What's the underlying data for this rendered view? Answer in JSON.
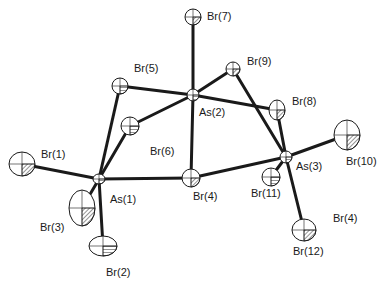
{
  "diagram": {
    "type": "ORTEP molecular structure",
    "colors": {
      "bond": "#1a1a1a",
      "atom_fill": "#ffffff",
      "hatch": "#2a2a2a",
      "text": "#1a1a1a"
    },
    "atoms": [
      {
        "id": "Br7",
        "label": "Br(7)",
        "x": 193,
        "y": 17,
        "rx": 8,
        "ry": 8,
        "lx": 207,
        "ly": 11
      },
      {
        "id": "Br5",
        "label": "Br(5)",
        "x": 120,
        "y": 86,
        "rx": 8,
        "ry": 8,
        "lx": 134,
        "ly": 63
      },
      {
        "id": "Br9",
        "label": "Br(9)",
        "x": 233,
        "y": 69,
        "rx": 7,
        "ry": 7,
        "lx": 247,
        "ly": 56
      },
      {
        "id": "As2",
        "label": "As(2)",
        "x": 193,
        "y": 95,
        "rx": 6,
        "ry": 6,
        "lx": 199,
        "ly": 107
      },
      {
        "id": "Br8",
        "label": "Br(8)",
        "x": 277,
        "y": 110,
        "rx": 8,
        "ry": 10,
        "lx": 292,
        "ly": 96
      },
      {
        "id": "Br6",
        "label": "Br(6)",
        "x": 130,
        "y": 126,
        "rx": 9,
        "ry": 9,
        "lx": 150,
        "ly": 146
      },
      {
        "id": "Br1",
        "label": "Br(1)",
        "x": 22,
        "y": 164,
        "rx": 13,
        "ry": 12,
        "lx": 41,
        "ly": 149
      },
      {
        "id": "As1",
        "label": "As(1)",
        "x": 99,
        "y": 179,
        "rx": 6,
        "ry": 5,
        "lx": 110,
        "ly": 194
      },
      {
        "id": "Br10",
        "label": "Br(10)",
        "x": 347,
        "y": 135,
        "rx": 13,
        "ry": 15,
        "lx": 346,
        "ly": 156
      },
      {
        "id": "As3",
        "label": "As(3)",
        "x": 286,
        "y": 157,
        "rx": 6,
        "ry": 6,
        "lx": 296,
        "ly": 161
      },
      {
        "id": "Br4",
        "label": "Br(4)",
        "x": 191,
        "y": 178,
        "rx": 9,
        "ry": 9,
        "lx": 193,
        "ly": 191
      },
      {
        "id": "Br11",
        "label": "Br(11)",
        "x": 271,
        "y": 177,
        "rx": 9,
        "ry": 9,
        "lx": 251,
        "ly": 188
      },
      {
        "id": "Br3",
        "label": "Br(3)",
        "x": 82,
        "y": 208,
        "rx": 13,
        "ry": 18,
        "lx": 40,
        "ly": 222
      },
      {
        "id": "Br2",
        "label": "Br(2)",
        "x": 103,
        "y": 246,
        "rx": 14,
        "ry": 10,
        "lx": 106,
        "ly": 267
      },
      {
        "id": "Br12",
        "label": "Br(12)",
        "x": 304,
        "y": 230,
        "rx": 12,
        "ry": 11,
        "lx": 293,
        "ly": 246
      },
      {
        "id": "Br4b",
        "label": "Br(4)",
        "x": null,
        "y": null,
        "rx": 0,
        "ry": 0,
        "lx": 333,
        "ly": 213
      }
    ],
    "bonds": [
      [
        "As2",
        "Br7"
      ],
      [
        "As2",
        "Br5"
      ],
      [
        "As2",
        "Br9"
      ],
      [
        "As2",
        "Br8"
      ],
      [
        "As2",
        "Br6"
      ],
      [
        "As2",
        "Br4"
      ],
      [
        "As1",
        "Br5"
      ],
      [
        "As1",
        "Br6"
      ],
      [
        "As1",
        "Br4"
      ],
      [
        "As1",
        "Br1"
      ],
      [
        "As1",
        "Br3"
      ],
      [
        "As1",
        "Br2"
      ],
      [
        "As3",
        "Br4"
      ],
      [
        "As3",
        "Br8"
      ],
      [
        "As3",
        "Br9"
      ],
      [
        "As3",
        "Br10"
      ],
      [
        "As3",
        "Br11"
      ],
      [
        "As3",
        "Br12"
      ]
    ]
  }
}
